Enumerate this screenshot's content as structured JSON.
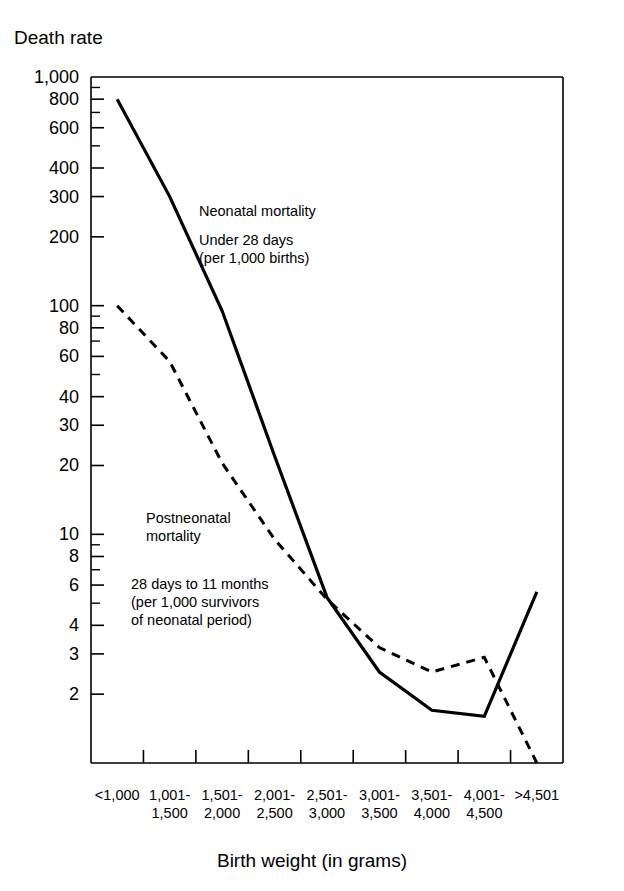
{
  "chart_data": {
    "type": "line",
    "title": "",
    "ylabel": "Death rate",
    "xlabel": "Birth weight (in grams)",
    "yscale": "log",
    "ylim": [
      1,
      1000
    ],
    "grid": false,
    "legend_position": "inline-annotations",
    "categories": [
      "<1,000",
      "1,001-\n1,500",
      "1,501-\n2,000",
      "2,001-\n2,500",
      "2,501-\n3,000",
      "3,001-\n3,500",
      "3,501-\n4,000",
      "4,001-\n4,500",
      ">4,501"
    ],
    "category_lines": [
      [
        "<1,000",
        ""
      ],
      [
        "1,001-",
        "1,500"
      ],
      [
        "1,501-",
        "2,000"
      ],
      [
        "2,001-",
        "2,500"
      ],
      [
        "2,501-",
        "3,000"
      ],
      [
        "3,001-",
        "3,500"
      ],
      [
        "3,501-",
        "4,000"
      ],
      [
        "4,001-",
        "4,500"
      ],
      [
        ">4,501",
        ""
      ]
    ],
    "y_tick_labels": [
      "1,000",
      "800",
      "600",
      "400",
      "300",
      "200",
      "100",
      "80",
      "60",
      "40",
      "30",
      "20",
      "10",
      "8",
      "6",
      "4",
      "3",
      "2"
    ],
    "y_tick_values": [
      1000,
      800,
      600,
      400,
      300,
      200,
      100,
      80,
      60,
      40,
      30,
      20,
      10,
      8,
      6,
      4,
      3,
      2
    ],
    "y_minor_ticks": [
      900,
      700,
      500,
      90,
      70,
      50,
      9,
      7,
      5
    ],
    "series": [
      {
        "name": "Neonatal mortality",
        "style": "solid",
        "values": [
          800,
          300,
          95,
          22,
          5.3,
          2.5,
          1.7,
          1.6,
          5.6
        ]
      },
      {
        "name": "Postneonatal mortality",
        "style": "dashed",
        "values": [
          100,
          57,
          20.5,
          9.5,
          5.2,
          3.2,
          2.5,
          2.9,
          1.0
        ]
      }
    ],
    "annotations": [
      {
        "id": "neonatal",
        "lines": [
          "Neonatal mortality",
          "Under 28 days",
          "(per 1,000 births)"
        ]
      },
      {
        "id": "postneonatal",
        "lines": [
          "Postneonatal",
          "mortality",
          "28 days to 11 months",
          "(per 1,000 survivors",
          "of neonatal period)"
        ]
      }
    ],
    "colors": {
      "axis": "#000000",
      "series_neonatal": "#000000",
      "series_postneonatal": "#000000",
      "background": "#ffffff"
    }
  }
}
